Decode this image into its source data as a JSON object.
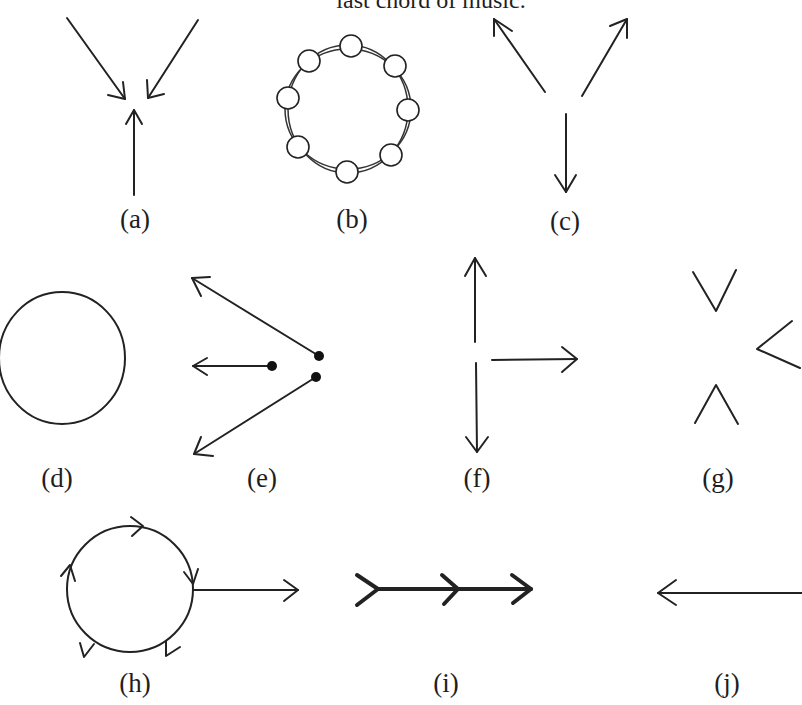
{
  "caption": {
    "text": "last chord of music."
  },
  "panels": [
    {
      "id": "a",
      "label": "(a)",
      "description": "three arrows converging to a point"
    },
    {
      "id": "b",
      "label": "(b)",
      "description": "ring of eight small circles on a loop"
    },
    {
      "id": "c",
      "label": "(c)",
      "description": "three arrows diverging from a point"
    },
    {
      "id": "d",
      "label": "(d)",
      "description": "plain circle"
    },
    {
      "id": "e",
      "label": "(e)",
      "description": "three arrows from dots pointing left"
    },
    {
      "id": "f",
      "label": "(f)",
      "description": "arrows pointing up, down and right"
    },
    {
      "id": "g",
      "label": "(g)",
      "description": "three chevrons pointing inward"
    },
    {
      "id": "h",
      "label": "(h)",
      "description": "circular loop with directional arrows and exit arrow"
    },
    {
      "id": "i",
      "label": "(i)",
      "description": "thick line with three chevrons pointing right"
    },
    {
      "id": "j",
      "label": "(j)",
      "description": "single arrow pointing left"
    }
  ],
  "colors": {
    "ink": "#222222",
    "background": "#ffffff"
  }
}
